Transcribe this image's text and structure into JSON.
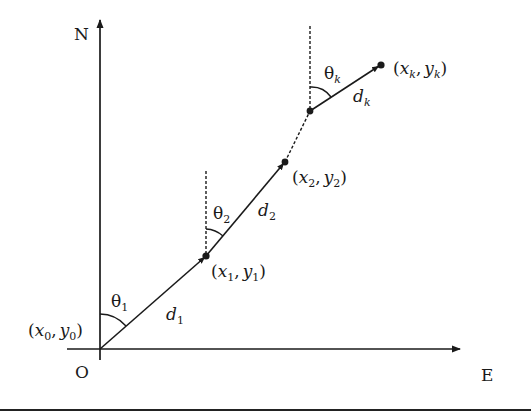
{
  "figure": {
    "axes": {
      "north_label": "N",
      "east_label": "E",
      "origin_label": "O"
    },
    "points": [
      {
        "id": "p0",
        "x_sym": "x",
        "y_sym": "y",
        "sub": "0"
      },
      {
        "id": "p1",
        "x_sym": "x",
        "y_sym": "y",
        "sub": "1"
      },
      {
        "id": "p2",
        "x_sym": "x",
        "y_sym": "y",
        "sub": "2"
      },
      {
        "id": "pk",
        "x_sym": "x",
        "y_sym": "y",
        "sub": "k"
      }
    ],
    "segments": [
      {
        "d_sym": "d",
        "d_sub": "1",
        "theta_sym": "θ",
        "theta_sub": "1"
      },
      {
        "d_sym": "d",
        "d_sub": "2",
        "theta_sym": "θ",
        "theta_sub": "2"
      },
      {
        "d_sym": "d",
        "d_sub": "k",
        "theta_sym": "θ",
        "theta_sub": "k"
      }
    ],
    "punct": {
      "open": "(",
      "comma": ",",
      "close": ")"
    }
  }
}
